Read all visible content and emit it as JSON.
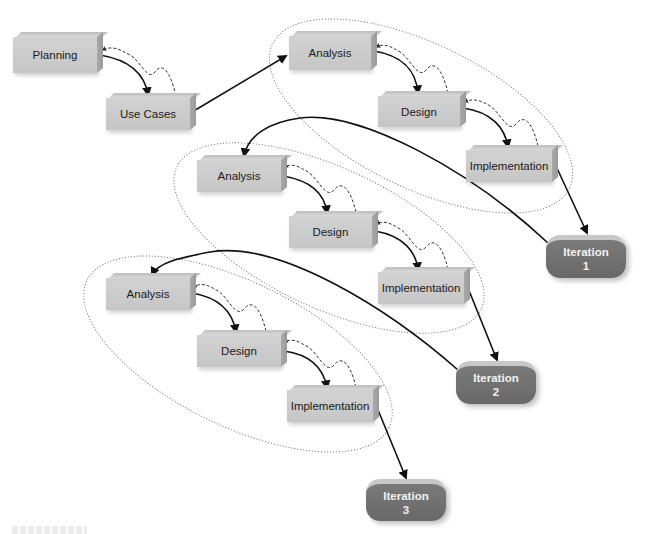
{
  "diagram": {
    "type": "iterative development process",
    "initial_steps": [
      {
        "id": "planning",
        "label": "Planning"
      },
      {
        "id": "use-cases",
        "label": "Use Cases"
      }
    ],
    "iterations": [
      {
        "id": "iteration-1",
        "phases": [
          {
            "label": "Analysis"
          },
          {
            "label": "Design"
          },
          {
            "label": "Implementation"
          }
        ],
        "result": {
          "line1": "Iteration",
          "line2": "1"
        }
      },
      {
        "id": "iteration-2",
        "phases": [
          {
            "label": "Analysis"
          },
          {
            "label": "Design"
          },
          {
            "label": "Implementation"
          }
        ],
        "result": {
          "line1": "Iteration",
          "line2": "2"
        }
      },
      {
        "id": "iteration-3",
        "phases": [
          {
            "label": "Analysis"
          },
          {
            "label": "Design"
          },
          {
            "label": "Implementation"
          }
        ],
        "result": {
          "line1": "Iteration",
          "line2": "3"
        }
      }
    ],
    "colors": {
      "phase_box": "#c9c9c9",
      "phase_box_side": "#9e9e9e",
      "iteration_pill": "#6e6e6e",
      "iteration_text": "#f2f2f2",
      "arrow": "#111111",
      "feedback_arrow": "#333333",
      "grouping_ellipse": "#777777"
    }
  }
}
